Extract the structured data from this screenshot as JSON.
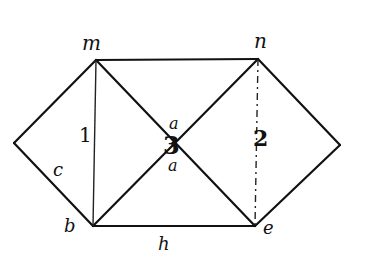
{
  "diagram": {
    "type": "hand-drawn geometric figure",
    "background": "#ffffff",
    "ink_color": "#111111",
    "vertices": [
      {
        "id": "m",
        "label": "m",
        "x": 96,
        "y": 60
      },
      {
        "id": "n",
        "label": "n",
        "x": 258,
        "y": 59
      },
      {
        "id": "b",
        "label": "b",
        "x": 93,
        "y": 226
      },
      {
        "id": "e",
        "label": "e",
        "x": 255,
        "y": 226
      },
      {
        "id": "left_apex",
        "label": "",
        "x": 14,
        "y": 143
      },
      {
        "id": "right_apex",
        "label": "",
        "x": 340,
        "y": 145
      }
    ],
    "edges": [
      {
        "from": "m",
        "to": "n",
        "style": "solid"
      },
      {
        "from": "b",
        "to": "e",
        "style": "solid"
      },
      {
        "from": "m",
        "to": "left_apex",
        "style": "solid"
      },
      {
        "from": "left_apex",
        "to": "b",
        "style": "solid"
      },
      {
        "from": "n",
        "to": "right_apex",
        "style": "solid"
      },
      {
        "from": "right_apex",
        "to": "e",
        "style": "solid"
      },
      {
        "from": "m",
        "to": "e",
        "style": "solid"
      },
      {
        "from": "n",
        "to": "b",
        "style": "solid"
      },
      {
        "from": "m",
        "to": "b",
        "style": "thin"
      },
      {
        "from": "n",
        "to": "e",
        "style": "dashed"
      }
    ],
    "labels": {
      "vertex_m": "m",
      "vertex_n": "n",
      "vertex_b": "b",
      "vertex_e": "e",
      "region_1": "1",
      "region_2": "2",
      "center_3": "3",
      "angle_a_top": "a",
      "angle_a_bottom": "a",
      "side_c": "c",
      "side_h": "h"
    }
  }
}
